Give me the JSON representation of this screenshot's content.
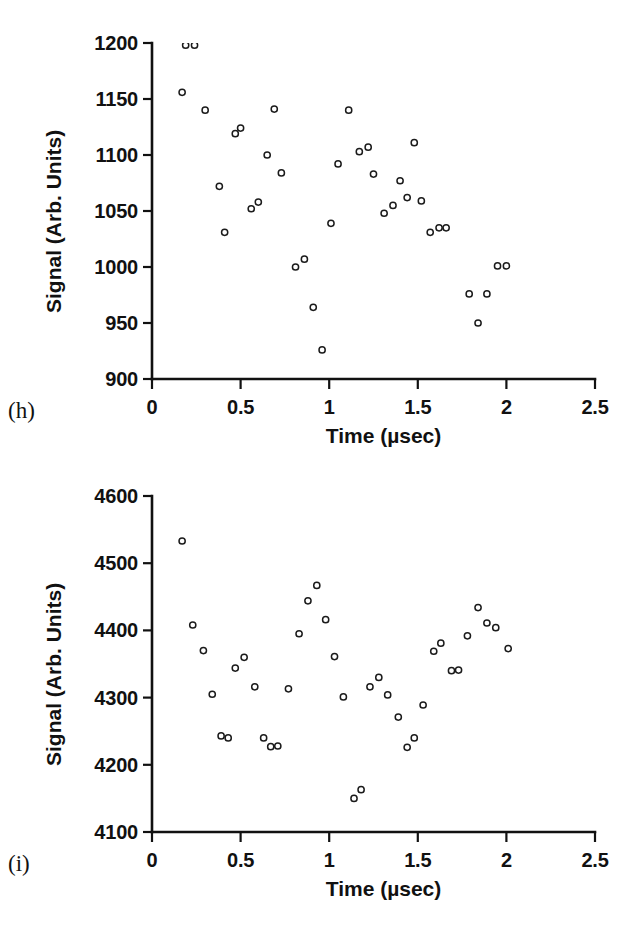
{
  "figure": {
    "background": "#ffffff",
    "ink_color": "#111111",
    "marker_shape": "open-circle",
    "marker_color": "#1b1b1b"
  },
  "panels": [
    {
      "id": "h",
      "letter": "(h)",
      "chart_data": {
        "type": "scatter",
        "title": "",
        "xlabel": "Time (µsec)",
        "ylabel": "Signal (Arb. Units)",
        "xlim": [
          0,
          2.5
        ],
        "ylim": [
          900,
          1200
        ],
        "xticks": [
          0,
          0.5,
          1,
          1.5,
          2,
          2.5
        ],
        "xtick_labels": [
          "0",
          "0.5",
          "1",
          "1.5",
          "2",
          "2.5"
        ],
        "yticks": [
          900,
          950,
          1000,
          1050,
          1100,
          1150,
          1200
        ],
        "ytick_labels": [
          "900",
          "950",
          "1000",
          "1050",
          "1100",
          "1150",
          "1200"
        ],
        "grid": false,
        "legend": null,
        "series": [
          {
            "name": "Signal",
            "points": [
              [
                0.17,
                1156
              ],
              [
                0.19,
                1198
              ],
              [
                0.24,
                1198
              ],
              [
                0.3,
                1140
              ],
              [
                0.38,
                1072
              ],
              [
                0.41,
                1031
              ],
              [
                0.47,
                1119
              ],
              [
                0.5,
                1124
              ],
              [
                0.56,
                1052
              ],
              [
                0.6,
                1058
              ],
              [
                0.65,
                1100
              ],
              [
                0.69,
                1141
              ],
              [
                0.73,
                1084
              ],
              [
                0.81,
                1000
              ],
              [
                0.86,
                1007
              ],
              [
                0.91,
                964
              ],
              [
                0.96,
                926
              ],
              [
                1.01,
                1039
              ],
              [
                1.05,
                1092
              ],
              [
                1.11,
                1140
              ],
              [
                1.17,
                1103
              ],
              [
                1.22,
                1107
              ],
              [
                1.25,
                1083
              ],
              [
                1.31,
                1048
              ],
              [
                1.36,
                1055
              ],
              [
                1.4,
                1077
              ],
              [
                1.44,
                1062
              ],
              [
                1.48,
                1111
              ],
              [
                1.52,
                1059
              ],
              [
                1.57,
                1031
              ],
              [
                1.62,
                1035
              ],
              [
                1.66,
                1035
              ],
              [
                1.79,
                976
              ],
              [
                1.84,
                950
              ],
              [
                1.89,
                976
              ],
              [
                1.95,
                1001
              ],
              [
                2.0,
                1001
              ]
            ]
          }
        ]
      }
    },
    {
      "id": "i",
      "letter": "(i)",
      "chart_data": {
        "type": "scatter",
        "title": "",
        "xlabel": "Time (µsec)",
        "ylabel": "Signal (Arb. Units)",
        "xlim": [
          0,
          2.5
        ],
        "ylim": [
          4100,
          4600
        ],
        "xticks": [
          0,
          0.5,
          1,
          1.5,
          2,
          2.5
        ],
        "xtick_labels": [
          "0",
          "0.5",
          "1",
          "1.5",
          "2",
          "2.5"
        ],
        "yticks": [
          4100,
          4200,
          4300,
          4400,
          4500,
          4600
        ],
        "ytick_labels": [
          "4100",
          "4200",
          "4300",
          "4400",
          "4500",
          "4600"
        ],
        "grid": false,
        "legend": null,
        "series": [
          {
            "name": "Signal",
            "points": [
              [
                0.17,
                4533
              ],
              [
                0.23,
                4408
              ],
              [
                0.29,
                4370
              ],
              [
                0.34,
                4305
              ],
              [
                0.39,
                4243
              ],
              [
                0.43,
                4240
              ],
              [
                0.47,
                4344
              ],
              [
                0.52,
                4360
              ],
              [
                0.58,
                4316
              ],
              [
                0.63,
                4240
              ],
              [
                0.67,
                4227
              ],
              [
                0.71,
                4228
              ],
              [
                0.77,
                4313
              ],
              [
                0.83,
                4395
              ],
              [
                0.88,
                4444
              ],
              [
                0.93,
                4467
              ],
              [
                0.98,
                4416
              ],
              [
                1.03,
                4361
              ],
              [
                1.08,
                4301
              ],
              [
                1.14,
                4150
              ],
              [
                1.18,
                4163
              ],
              [
                1.23,
                4316
              ],
              [
                1.28,
                4330
              ],
              [
                1.33,
                4304
              ],
              [
                1.39,
                4271
              ],
              [
                1.44,
                4226
              ],
              [
                1.48,
                4240
              ],
              [
                1.53,
                4289
              ],
              [
                1.59,
                4369
              ],
              [
                1.63,
                4381
              ],
              [
                1.69,
                4340
              ],
              [
                1.73,
                4341
              ],
              [
                1.78,
                4392
              ],
              [
                1.84,
                4434
              ],
              [
                1.89,
                4411
              ],
              [
                1.94,
                4404
              ],
              [
                2.01,
                4373
              ]
            ]
          }
        ]
      }
    }
  ]
}
